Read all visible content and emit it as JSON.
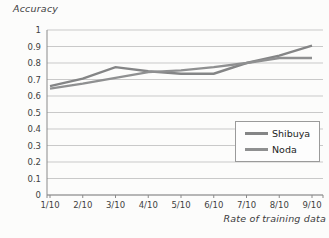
{
  "chart_data": {
    "type": "line",
    "title": "",
    "ylabel": "Accuracy",
    "xlabel": "Rate of training data",
    "categories": [
      "1/10",
      "2/10",
      "3/10",
      "4/10",
      "5/10",
      "6/10",
      "7/10",
      "8/10",
      "9/10"
    ],
    "series": [
      {
        "name": "Shibuya",
        "color": "#848586",
        "values": [
          0.66,
          0.705,
          0.775,
          0.75,
          0.735,
          0.735,
          0.8,
          0.845,
          0.905
        ]
      },
      {
        "name": "Noda",
        "color": "#8f9091",
        "values": [
          0.645,
          0.675,
          0.71,
          0.745,
          0.755,
          0.775,
          0.8,
          0.83,
          0.83
        ]
      }
    ],
    "ylim": [
      0,
      1
    ],
    "ytick_step": 0.1,
    "ytick_labels": [
      "1",
      "0.9",
      "0.8",
      "0.7",
      "0.6",
      "0.5",
      "0.4",
      "0.3",
      "0.2",
      "0.1",
      "0"
    ],
    "grid": true,
    "legend_position": "middle-right",
    "colors": {
      "gridline": "#c9c9c9",
      "axis": "#8a8a8a",
      "tick_text": "#3f3f3f"
    }
  }
}
